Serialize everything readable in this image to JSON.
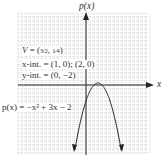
{
  "chart_data": {
    "type": "line",
    "title": "",
    "xlabel": "x",
    "ylabel": "p(x)",
    "function": "p(x) = -x^2 + 3x - 2",
    "grid": true,
    "xlim": [
      -8.5,
      7.5
    ],
    "ylim": [
      -8.5,
      8.5
    ],
    "series": [
      {
        "name": "p(x) = −x² + 3x − 2",
        "x": [
          -1.5,
          -1,
          -0.5,
          0,
          0.5,
          1,
          1.5,
          2,
          2.5,
          3,
          3.5,
          4,
          4.5
        ],
        "y": [
          -8.75,
          -6,
          -3.75,
          -2,
          -0.75,
          0,
          0.25,
          0,
          -0.75,
          -2,
          -3.75,
          -6,
          -8.75
        ]
      }
    ],
    "annotations": [
      {
        "text": "V = (3/2, 1/4)"
      },
      {
        "text": "x-int. = (1, 0); (2, 0)"
      },
      {
        "text": "y-int. = (0, −2)"
      },
      {
        "text": "p(x) = −x² + 3x − 2"
      }
    ]
  },
  "labels": {
    "y_axis": "p(x)",
    "x_axis": "x",
    "vertex": "V = (",
    "vertex_frac": "3/2, 1/4",
    "x_int": "x-int. = (1, 0); (2, 0)",
    "y_int": "y-int. = (0, −2)",
    "func": "p(x) = −x² + 3x − 2"
  }
}
